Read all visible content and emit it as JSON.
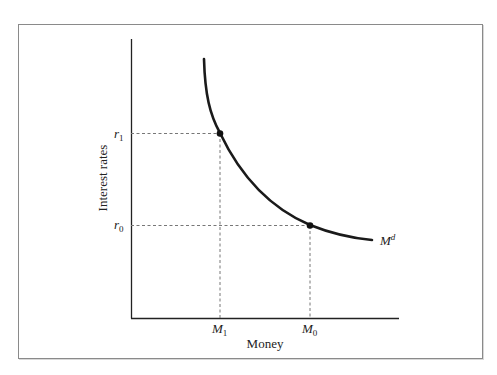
{
  "diagram": {
    "y_axis_label": "Interest rates",
    "x_axis_label": "Money",
    "y_ticks": [
      {
        "label": "r",
        "sub": "1"
      },
      {
        "label": "r",
        "sub": "0"
      }
    ],
    "x_ticks": [
      {
        "label": "M",
        "sub": "1"
      },
      {
        "label": "M",
        "sub": "0"
      }
    ],
    "curve_label": {
      "base": "M",
      "sup": "d"
    },
    "points": [
      {
        "name": "(M1, r1)",
        "x": "M1",
        "y": "r1"
      },
      {
        "name": "(M0, r0)",
        "x": "M0",
        "y": "r0"
      }
    ],
    "colors": {
      "curve": "#1a1a1a",
      "axes": "#222222",
      "guides": "#777777",
      "frame": "#8a8a8a"
    }
  }
}
